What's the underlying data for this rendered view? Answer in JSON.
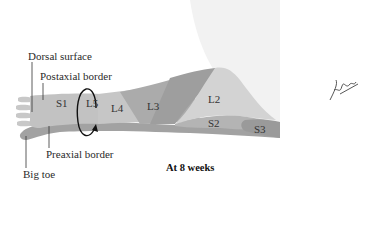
{
  "figure": {
    "caption": "At 8 weeks",
    "labels": {
      "dorsal_surface": "Dorsal surface",
      "postaxial_border": "Postaxial border",
      "preaxial_border": "Preaxial border",
      "big_toe": "Big toe"
    },
    "segments": [
      "S1",
      "L5",
      "L4",
      "L3",
      "L2",
      "S2",
      "S3"
    ],
    "signature": "F. Netter M.D.",
    "colors": {
      "torso": "#f1f1f1",
      "foot_light": "#c9c9c9",
      "s1": "#bdbdbd",
      "l5": "#c4c4c4",
      "l4": "#a8a8a8",
      "l3": "#9c9c9c",
      "l2": "#d2d2d2",
      "s2": "#b2b2b2",
      "s3": "#999999",
      "preaxial": "#9d9d9d"
    }
  }
}
